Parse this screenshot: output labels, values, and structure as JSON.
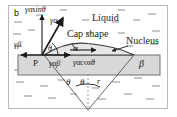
{
  "figure": {
    "panel_id": "b",
    "caption_type": "heterogeneous-nucleation-force-balance",
    "colors": {
      "frame_border": "#b9b9b9",
      "background": "#ffffff",
      "substrate_fill": "#d8d8d8",
      "substrate_stroke": "#6e6e6e",
      "nucleus_fill": "#e6e6e6",
      "line": "#1a1a1a",
      "hatch": "#9a9a9a"
    }
  },
  "labels": {
    "gamma_alpha_sin_theta": "γαsinθ",
    "gamma_alpha": "γα",
    "liquid": "Liquid",
    "cap_shape": "Cap shape",
    "nucleus": "Nucleus",
    "gamma_beta": "γβ",
    "theta_contact": "θ",
    "alpha": "α",
    "point_P": "P",
    "gamma_alpha_beta": "γαβ",
    "gamma_alpha_cos_theta": "γαcosθ",
    "beta_phase": "β",
    "theta_left": "θ",
    "theta_right": "θ",
    "radius": "r"
  },
  "geometry": {
    "substrate": {
      "x": 18,
      "y": 55,
      "width": 142,
      "height": 20
    },
    "point_P": {
      "x": 42,
      "y": 55
    },
    "nucleus_apex": {
      "x": 88,
      "y": 44
    },
    "nucleus_right_contact": {
      "x": 134,
      "y": 55
    },
    "sphere_center": {
      "x": 88,
      "y": 110
    },
    "contact_angle_deg": 24,
    "vector_gamma_alpha_tip": {
      "x": 63,
      "y": 17
    },
    "vector_gamma_alpha_sin_theta_tip": {
      "x": 42,
      "y": 14
    },
    "vector_gamma_beta_tip": {
      "x": 21,
      "y": 55
    },
    "vector_gamma_alpha_beta_tip": {
      "x": 68,
      "y": 55
    }
  }
}
